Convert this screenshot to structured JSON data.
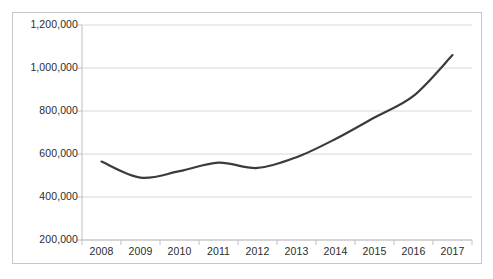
{
  "chart_data": {
    "type": "line",
    "title": "",
    "subtitle": "",
    "xlabel": "",
    "ylabel": "",
    "categories": [
      "2008",
      "2009",
      "2010",
      "2011",
      "2012",
      "2013",
      "2014",
      "2015",
      "2016",
      "2017"
    ],
    "series": [
      {
        "name": "",
        "values": [
          565000,
          490000,
          520000,
          560000,
          535000,
          585000,
          670000,
          770000,
          870000,
          1060000
        ]
      }
    ],
    "ylim": [
      200000,
      1200000
    ],
    "ytick_values": [
      200000,
      400000,
      600000,
      800000,
      1000000,
      1200000
    ],
    "ytick_labels": [
      "200,000",
      "400,000",
      "600,000",
      "800,000",
      "1,000,000",
      "1,200,000"
    ],
    "xtick_labels": [
      "2008",
      "2009",
      "2010",
      "2011",
      "2012",
      "2013",
      "2014",
      "2015",
      "2016",
      "2017"
    ],
    "grid": true,
    "grid_axis": "y",
    "legend": false,
    "legend_position": "none",
    "smoothing": true,
    "annotations": []
  },
  "style": {
    "line_color": "#3b3b3b",
    "line_width": 2.2,
    "grid_color": "#d9d9d9",
    "axis_color": "#bfbfbf",
    "border_color": "#c8c8c8",
    "plot_background": "#ffffff",
    "page_background": "#ffffff",
    "tick_label_color": "#2b2b2b"
  },
  "geometry": {
    "plot_left": 82,
    "plot_right": 472,
    "plot_top": 25,
    "plot_bottom": 240
  }
}
